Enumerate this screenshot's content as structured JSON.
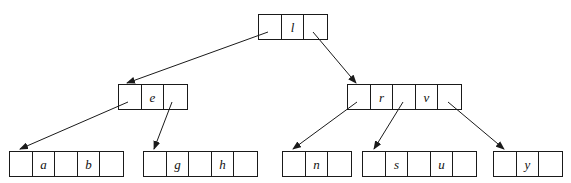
{
  "figure": {
    "type": "b-tree-diagram",
    "width": 571,
    "height": 183,
    "background_color": "#ffffff",
    "line_color": "#1a1a1a",
    "text_color": "#111111"
  },
  "nodes": [
    {
      "id": "root",
      "level": 0,
      "x": 258,
      "y": 14,
      "cells": [
        {
          "kind": "pointer",
          "label": ""
        },
        {
          "kind": "key",
          "label": "l"
        },
        {
          "kind": "pointer",
          "label": ""
        }
      ]
    },
    {
      "id": "internal-left",
      "level": 1,
      "x": 118,
      "y": 84,
      "cells": [
        {
          "kind": "pointer",
          "label": ""
        },
        {
          "kind": "key",
          "label": "e"
        },
        {
          "kind": "pointer",
          "label": ""
        }
      ]
    },
    {
      "id": "internal-right",
      "level": 1,
      "x": 347,
      "y": 84,
      "cells": [
        {
          "kind": "pointer",
          "label": ""
        },
        {
          "kind": "key",
          "label": "r"
        },
        {
          "kind": "pointer",
          "label": ""
        },
        {
          "kind": "key",
          "label": "v"
        },
        {
          "kind": "pointer",
          "label": ""
        }
      ]
    },
    {
      "id": "leaf-ab",
      "level": 2,
      "x": 9,
      "y": 151,
      "cells": [
        {
          "kind": "pointer",
          "label": ""
        },
        {
          "kind": "key",
          "label": "a"
        },
        {
          "kind": "pointer",
          "label": ""
        },
        {
          "kind": "key",
          "label": "b"
        },
        {
          "kind": "pointer",
          "label": ""
        }
      ]
    },
    {
      "id": "leaf-gh",
      "level": 2,
      "x": 143,
      "y": 151,
      "cells": [
        {
          "kind": "pointer",
          "label": ""
        },
        {
          "kind": "key",
          "label": "g"
        },
        {
          "kind": "pointer",
          "label": ""
        },
        {
          "kind": "key",
          "label": "h"
        },
        {
          "kind": "pointer",
          "label": ""
        }
      ]
    },
    {
      "id": "leaf-n",
      "level": 2,
      "x": 282,
      "y": 151,
      "cells": [
        {
          "kind": "pointer",
          "label": ""
        },
        {
          "kind": "key",
          "label": "n"
        },
        {
          "kind": "pointer",
          "label": ""
        }
      ]
    },
    {
      "id": "leaf-su",
      "level": 2,
      "x": 362,
      "y": 151,
      "cells": [
        {
          "kind": "pointer",
          "label": ""
        },
        {
          "kind": "key",
          "label": "s"
        },
        {
          "kind": "pointer",
          "label": ""
        },
        {
          "kind": "key",
          "label": "u"
        },
        {
          "kind": "pointer",
          "label": ""
        }
      ]
    },
    {
      "id": "leaf-y",
      "level": 2,
      "x": 493,
      "y": 151,
      "cells": [
        {
          "kind": "pointer",
          "label": ""
        },
        {
          "kind": "key",
          "label": "y"
        },
        {
          "kind": "pointer",
          "label": ""
        }
      ]
    }
  ],
  "edges": [
    {
      "id": "root-to-left",
      "from": "root",
      "to": "internal-left",
      "x1": 268,
      "y1": 32,
      "x2": 127,
      "y2": 83
    },
    {
      "id": "root-to-right",
      "from": "root",
      "to": "internal-right",
      "x1": 313,
      "y1": 32,
      "x2": 356,
      "y2": 83
    },
    {
      "id": "left-to-leaf-ab",
      "from": "internal-left",
      "to": "leaf-ab",
      "x1": 128,
      "y1": 102,
      "x2": 20,
      "y2": 149
    },
    {
      "id": "left-to-leaf-gh",
      "from": "internal-left",
      "to": "leaf-gh",
      "x1": 172,
      "y1": 102,
      "x2": 154,
      "y2": 149
    },
    {
      "id": "right-to-leaf-n",
      "from": "internal-right",
      "to": "leaf-n",
      "x1": 357,
      "y1": 102,
      "x2": 293,
      "y2": 149
    },
    {
      "id": "right-to-leaf-su",
      "from": "internal-right",
      "to": "leaf-su",
      "x1": 403,
      "y1": 102,
      "x2": 374,
      "y2": 149
    },
    {
      "id": "right-to-leaf-y",
      "from": "internal-right",
      "to": "leaf-y",
      "x1": 448,
      "y1": 102,
      "x2": 504,
      "y2": 149
    }
  ]
}
